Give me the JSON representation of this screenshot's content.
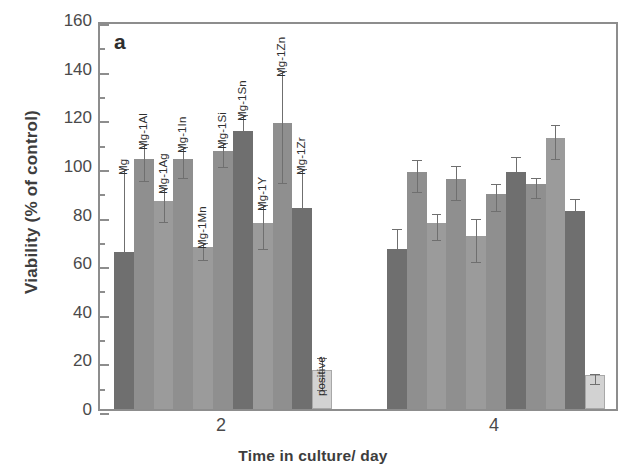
{
  "figure": {
    "panel_label": "a",
    "ylabel": "Viability (% of control)",
    "xlabel": "Time in culture/ day"
  },
  "axis": {
    "y_ticks": [
      "0",
      "20",
      "40",
      "60",
      "80",
      "100",
      "120",
      "140",
      "160"
    ],
    "x_ticks": [
      "2",
      "4"
    ]
  },
  "colors": {
    "bar_dark": "#6f6f6f",
    "bar_mid": "#8f8f8f",
    "bar_light": "#9b9b9b",
    "bar_positive": "#d2d2d2",
    "axis": "#8d8d8d",
    "error": "#6f6f6f",
    "text": "#3d3d3d"
  },
  "chart_data": {
    "type": "bar",
    "title": "",
    "panel": "a",
    "xlabel": "Time in culture/ day",
    "ylabel": "Viability (% of control)",
    "ylim": [
      0,
      160
    ],
    "ytick_step": 20,
    "yminor_step": 10,
    "grid": false,
    "legend": null,
    "categories": [
      "2",
      "4"
    ],
    "bar_labels": [
      "Mg",
      "Mg-1Al",
      "Mg-1Ag",
      "Mg-1In",
      "Mg-1Mn",
      "Mg-1Si",
      "Mg-1Sn",
      "Mg-1Y",
      "Mg-1Zn",
      "Mg-1Zr",
      "positive"
    ],
    "series": [
      {
        "name": "Day 2",
        "group": "2",
        "bars": [
          {
            "label": "Mg",
            "value": 64.5,
            "err_up": 36.0,
            "err_dn": 0.0,
            "shade": "dark"
          },
          {
            "label": "Mg-1Al",
            "value": 103.0,
            "err_up": 7.5,
            "err_dn": 7.5,
            "shade": "mid"
          },
          {
            "label": "Mg-1Ag",
            "value": 85.5,
            "err_up": 7.0,
            "err_dn": 7.0,
            "shade": "light"
          },
          {
            "label": "Mg-1In",
            "value": 103.0,
            "err_up": 6.5,
            "err_dn": 6.5,
            "shade": "mid"
          },
          {
            "label": "Mg-1Mn",
            "value": 66.5,
            "err_up": 3.5,
            "err_dn": 3.5,
            "shade": "light"
          },
          {
            "label": "Mg-1Si",
            "value": 106.0,
            "err_up": 5.0,
            "err_dn": 5.0,
            "shade": "mid"
          },
          {
            "label": "Mg-1Sn",
            "value": 114.5,
            "err_up": 8.0,
            "err_dn": 8.0,
            "shade": "dark"
          },
          {
            "label": "Mg-1Y",
            "value": 76.5,
            "err_up": 9.0,
            "err_dn": 9.0,
            "shade": "light"
          },
          {
            "label": "Mg-1Zn",
            "value": 117.5,
            "err_up": 23.0,
            "err_dn": 23.0,
            "shade": "mid"
          },
          {
            "label": "Mg-1Zr",
            "value": 82.5,
            "err_up": 18.0,
            "err_dn": 18.0,
            "shade": "dark"
          },
          {
            "label": "positive",
            "value": 16.0,
            "err_up": 6.5,
            "err_dn": 6.5,
            "shade": "positive"
          }
        ]
      },
      {
        "name": "Day 4",
        "group": "4",
        "bars": [
          {
            "label": "Mg",
            "value": 66.0,
            "err_up": 9.5,
            "err_dn": 9.5,
            "shade": "dark"
          },
          {
            "label": "Mg-1Al",
            "value": 97.5,
            "err_up": 6.5,
            "err_dn": 6.5,
            "shade": "mid"
          },
          {
            "label": "Mg-1Ag",
            "value": 76.5,
            "err_up": 5.5,
            "err_dn": 5.5,
            "shade": "light"
          },
          {
            "label": "Mg-1In",
            "value": 94.5,
            "err_up": 7.0,
            "err_dn": 7.0,
            "shade": "mid"
          },
          {
            "label": "Mg-1Mn",
            "value": 71.0,
            "err_up": 9.0,
            "err_dn": 9.0,
            "shade": "light"
          },
          {
            "label": "Mg-1Si",
            "value": 88.5,
            "err_up": 5.5,
            "err_dn": 5.5,
            "shade": "mid"
          },
          {
            "label": "Mg-1Sn",
            "value": 97.5,
            "err_up": 8.0,
            "err_dn": 8.0,
            "shade": "dark"
          },
          {
            "label": "Mg-1Y",
            "value": 92.5,
            "err_up": 4.0,
            "err_dn": 4.0,
            "shade": "mid"
          },
          {
            "label": "Mg-1Zn",
            "value": 111.5,
            "err_up": 7.0,
            "err_dn": 7.0,
            "shade": "light"
          },
          {
            "label": "Mg-1Zr",
            "value": 81.5,
            "err_up": 6.5,
            "err_dn": 6.5,
            "shade": "dark"
          },
          {
            "label": "positive",
            "value": 14.0,
            "err_up": 2.0,
            "err_dn": 2.0,
            "shade": "positive"
          }
        ]
      }
    ],
    "bar_label_placement": [
      {
        "group": 0,
        "index": 0,
        "label": "Mg",
        "show": true
      },
      {
        "group": 0,
        "index": 1,
        "label": "Mg-1Al",
        "show": true
      },
      {
        "group": 0,
        "index": 2,
        "label": "Mg-1Ag",
        "show": true
      },
      {
        "group": 0,
        "index": 3,
        "label": "Mg-1In",
        "show": true
      },
      {
        "group": 0,
        "index": 4,
        "label": "Mg-1Mn",
        "show": true
      },
      {
        "group": 0,
        "index": 5,
        "label": "Mg-1Si",
        "show": true
      },
      {
        "group": 0,
        "index": 6,
        "label": "Mg-1Sn",
        "show": true
      },
      {
        "group": 0,
        "index": 7,
        "label": "Mg-1Y",
        "show": true
      },
      {
        "group": 0,
        "index": 8,
        "label": "Mg-1Zn",
        "show": true
      },
      {
        "group": 0,
        "index": 9,
        "label": "Mg-1Zr",
        "show": true
      },
      {
        "group": 0,
        "index": 10,
        "label": "positive",
        "show": true
      }
    ]
  }
}
